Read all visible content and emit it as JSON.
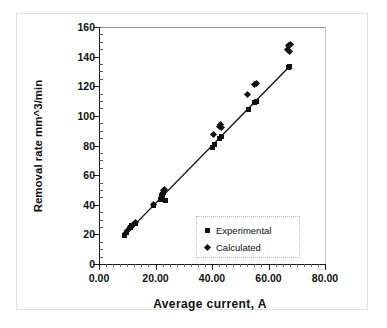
{
  "chart_data": {
    "type": "scatter",
    "title": "",
    "xlabel": "Average  current, A",
    "ylabel": "Removal rate mm^3/min",
    "xlim": [
      0,
      80
    ],
    "ylim": [
      0,
      160
    ],
    "xticks": [
      "0.00",
      "20.00",
      "40.00",
      "60.00",
      "80.00"
    ],
    "xtick_values": [
      0,
      20,
      40,
      60,
      80
    ],
    "yticks": [
      "0",
      "20",
      "40",
      "60",
      "80",
      "100",
      "120",
      "140",
      "160"
    ],
    "ytick_values": [
      0,
      20,
      40,
      60,
      80,
      100,
      120,
      140,
      160
    ],
    "grid": false,
    "legend_position": "lower-right",
    "trendline": {
      "from": [
        9.0,
        19.5
      ],
      "to": [
        67.5,
        133.5
      ]
    },
    "series": [
      {
        "name": "Experimental",
        "marker": "square",
        "color": "#111111",
        "points": [
          [
            9.2,
            19.5
          ],
          [
            9.8,
            21.0
          ],
          [
            11.0,
            24.5
          ],
          [
            11.6,
            26.0
          ],
          [
            12.8,
            27.5
          ],
          [
            19.2,
            39.5
          ],
          [
            21.8,
            43.5
          ],
          [
            22.3,
            45.5
          ],
          [
            22.6,
            47.0
          ],
          [
            23.0,
            48.5
          ],
          [
            23.4,
            43.0
          ],
          [
            40.2,
            78.5
          ],
          [
            41.0,
            80.5
          ],
          [
            42.8,
            84.5
          ],
          [
            43.4,
            86.0
          ],
          [
            52.8,
            104.5
          ],
          [
            55.2,
            109.0
          ],
          [
            55.8,
            110.0
          ],
          [
            67.0,
            132.5
          ],
          [
            67.6,
            133.5
          ]
        ]
      },
      {
        "name": "Calculated",
        "marker": "diamond",
        "color": "#111111",
        "points": [
          [
            9.5,
            20.5
          ],
          [
            10.4,
            23.5
          ],
          [
            11.2,
            25.5
          ],
          [
            12.2,
            27.0
          ],
          [
            13.0,
            28.0
          ],
          [
            19.4,
            40.5
          ],
          [
            22.0,
            45.0
          ],
          [
            22.5,
            47.5
          ],
          [
            22.9,
            49.5
          ],
          [
            23.2,
            50.5
          ],
          [
            40.6,
            87.5
          ],
          [
            42.6,
            93.0
          ],
          [
            43.0,
            94.5
          ],
          [
            43.2,
            92.0
          ],
          [
            52.6,
            114.5
          ],
          [
            55.0,
            121.0
          ],
          [
            55.6,
            122.0
          ],
          [
            66.8,
            145.0
          ],
          [
            67.2,
            147.5
          ],
          [
            67.6,
            143.5
          ],
          [
            67.8,
            148.0
          ]
        ]
      }
    ]
  },
  "legend": {
    "items": [
      {
        "label": "Experimental",
        "marker": "square"
      },
      {
        "label": "Calculated",
        "marker": "diamond"
      }
    ]
  }
}
